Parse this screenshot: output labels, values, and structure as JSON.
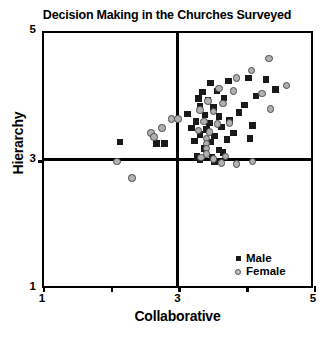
{
  "chart_data": {
    "type": "scatter",
    "title": "Decision Making in the Churches Surveyed",
    "xlabel": "Collaborative",
    "ylabel": "Hierarchy",
    "xlim": [
      1,
      5
    ],
    "ylim": [
      1,
      5
    ],
    "xticks": [
      1,
      3,
      5
    ],
    "xtick_labels": [
      "1",
      "3",
      "5"
    ],
    "xticks_minor": [
      2,
      4
    ],
    "yticks": [
      1,
      3,
      5
    ],
    "ytick_labels": [
      "1",
      "3",
      "5"
    ],
    "grid": false,
    "reference_lines": {
      "vertical_x": 3,
      "horizontal_y": 3
    },
    "legend_position": "bottom-right",
    "series": [
      {
        "name": "Male",
        "marker": "filled-square",
        "color": "#1a1a1a",
        "points": [
          [
            3.46,
            4.22
          ],
          [
            3.72,
            4.25
          ],
          [
            4.02,
            4.3
          ],
          [
            4.28,
            4.28
          ],
          [
            3.34,
            4.08
          ],
          [
            3.55,
            4.1
          ],
          [
            4.42,
            4.12
          ],
          [
            3.28,
            3.98
          ],
          [
            3.42,
            3.96
          ],
          [
            3.66,
            3.99
          ],
          [
            4.13,
            4.02
          ],
          [
            3.3,
            3.86
          ],
          [
            3.5,
            3.84
          ],
          [
            3.96,
            3.88
          ],
          [
            3.12,
            3.74
          ],
          [
            3.38,
            3.72
          ],
          [
            3.58,
            3.7
          ],
          [
            3.88,
            3.76
          ],
          [
            3.24,
            3.62
          ],
          [
            3.44,
            3.6
          ],
          [
            3.74,
            3.64
          ],
          [
            3.18,
            3.52
          ],
          [
            3.4,
            3.5
          ],
          [
            3.62,
            3.54
          ],
          [
            4.08,
            3.56
          ],
          [
            3.3,
            3.42
          ],
          [
            3.52,
            3.4
          ],
          [
            3.8,
            3.44
          ],
          [
            3.22,
            3.32
          ],
          [
            3.46,
            3.3
          ],
          [
            3.7,
            3.34
          ],
          [
            4.04,
            3.36
          ],
          [
            2.12,
            3.3
          ],
          [
            2.66,
            3.28
          ],
          [
            2.78,
            3.28
          ],
          [
            3.36,
            3.2
          ],
          [
            3.58,
            3.18
          ],
          [
            3.26,
            3.08
          ],
          [
            3.48,
            3.06
          ],
          [
            3.64,
            3.14
          ],
          [
            3.3,
            3.02
          ],
          [
            3.52,
            3.0
          ]
        ]
      },
      {
        "name": "Female",
        "marker": "open-circle",
        "color": "#b0b0b0",
        "points": [
          [
            4.32,
            4.6
          ],
          [
            4.06,
            4.42
          ],
          [
            3.84,
            4.3
          ],
          [
            4.58,
            4.18
          ],
          [
            4.22,
            4.06
          ],
          [
            3.58,
            4.14
          ],
          [
            3.8,
            4.1
          ],
          [
            3.42,
            3.94
          ],
          [
            3.64,
            3.9
          ],
          [
            4.34,
            3.82
          ],
          [
            3.3,
            3.8
          ],
          [
            3.5,
            3.78
          ],
          [
            2.88,
            3.66
          ],
          [
            2.98,
            3.66
          ],
          [
            3.36,
            3.62
          ],
          [
            3.56,
            3.58
          ],
          [
            3.74,
            3.6
          ],
          [
            2.74,
            3.52
          ],
          [
            3.28,
            3.48
          ],
          [
            3.44,
            3.46
          ],
          [
            3.4,
            3.36
          ],
          [
            3.4,
            3.28
          ],
          [
            3.4,
            3.2
          ],
          [
            3.4,
            3.12
          ],
          [
            3.32,
            3.06
          ],
          [
            3.5,
            3.04
          ],
          [
            3.68,
            3.08
          ],
          [
            2.58,
            3.44
          ],
          [
            2.62,
            3.38
          ],
          [
            3.62,
            2.98
          ],
          [
            3.84,
            2.96
          ],
          [
            2.08,
            3.0
          ],
          [
            4.08,
            3.0
          ],
          [
            2.3,
            2.74
          ]
        ]
      }
    ]
  },
  "legend": {
    "male_label": "Male",
    "female_label": "Female"
  }
}
